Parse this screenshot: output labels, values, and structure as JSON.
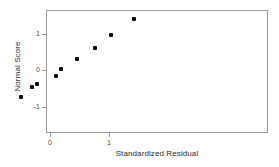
{
  "chart_data": {
    "type": "scatter",
    "title": "",
    "xlabel": "Standardized Residual",
    "ylabel": "Normal Score",
    "xlim": [
      -2.27,
      1.49
    ],
    "ylim": [
      -1.72,
      1.6
    ],
    "xticks": [
      -2,
      -1,
      0,
      1
    ],
    "xticklabels": [
      "-2",
      "-1",
      "0",
      "1"
    ],
    "yticks": [
      -1,
      0,
      1
    ],
    "yticklabels": [
      "-1",
      "0",
      "1"
    ],
    "grid": false,
    "legend": null,
    "marker": "filled-square",
    "marker_color": "#0d0d0d",
    "frame_color": "#9a9a9a",
    "points": [
      {
        "x": -1.73,
        "y": -1.54
      },
      {
        "x": -1.44,
        "y": -1.08
      },
      {
        "x": -0.51,
        "y": -0.7
      },
      {
        "x": -0.32,
        "y": -0.44
      },
      {
        "x": -0.23,
        "y": -0.36
      },
      {
        "x": 0.08,
        "y": -0.13
      },
      {
        "x": 0.17,
        "y": 0.06
      },
      {
        "x": 0.44,
        "y": 0.34
      },
      {
        "x": 0.74,
        "y": 0.63
      },
      {
        "x": 1.02,
        "y": 0.99
      },
      {
        "x": 1.41,
        "y": 1.42
      }
    ]
  }
}
